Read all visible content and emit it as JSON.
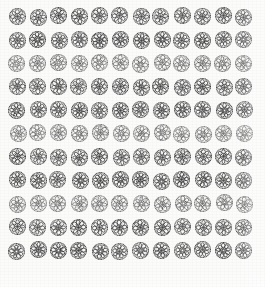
{
  "sheet": {
    "title": "Halftone rosette pattern swatch",
    "description": "Printed repeat pattern of circular floral rosette motifs arranged in a regular grid",
    "width_px": 265,
    "height_px": 287,
    "background_color": "#fbfbfa",
    "ink_color": "#2b2b2b",
    "ink_color_light": "#6e6e6e",
    "motif_name": "circular floral rosette",
    "motif_diameter_px": 17
  },
  "grid": {
    "columns": 12,
    "rows": 11,
    "total_motifs": 132,
    "column_pitch_px": 20.6,
    "row_pitch_px": 23.4,
    "origin_x_px": 9,
    "origin_y_px": 8
  },
  "motif_variants": [
    {
      "id": "v1",
      "petals": 8,
      "rotation_deg": 0,
      "center_dot": true
    },
    {
      "id": "v2",
      "petals": 7,
      "rotation_deg": 14,
      "center_dot": true
    },
    {
      "id": "v3",
      "petals": 9,
      "rotation_deg": 27,
      "center_dot": false
    },
    {
      "id": "v4",
      "petals": 8,
      "rotation_deg": 41,
      "center_dot": true
    },
    {
      "id": "v5",
      "petals": 7,
      "rotation_deg": 8,
      "center_dot": false
    },
    {
      "id": "v6",
      "petals": 9,
      "rotation_deg": 33,
      "center_dot": true
    }
  ],
  "rows_data": [
    {
      "index": 1,
      "tone": "dark",
      "motif_count": 12
    },
    {
      "index": 2,
      "tone": "dark",
      "motif_count": 12
    },
    {
      "index": 3,
      "tone": "medium",
      "motif_count": 12
    },
    {
      "index": 4,
      "tone": "dark",
      "motif_count": 12
    },
    {
      "index": 5,
      "tone": "dark",
      "motif_count": 12
    },
    {
      "index": 6,
      "tone": "medium",
      "motif_count": 12
    },
    {
      "index": 7,
      "tone": "dark",
      "motif_count": 12
    },
    {
      "index": 8,
      "tone": "dark",
      "motif_count": 12
    },
    {
      "index": 9,
      "tone": "medium",
      "motif_count": 12
    },
    {
      "index": 10,
      "tone": "dark",
      "motif_count": 12
    },
    {
      "index": 11,
      "tone": "dark",
      "motif_count": 12
    }
  ]
}
